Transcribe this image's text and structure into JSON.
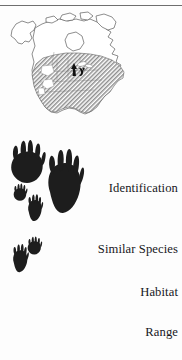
{
  "page": {
    "background_color": "#fdfdfd",
    "rule_color": "#6e6e6e",
    "text_color": "#17171c"
  },
  "range_map": {
    "name": "north-america-range-map",
    "outline_color": "#5a5a5a",
    "range_fill_color": "#8f8f8f",
    "land_fill_color": "#ffffff",
    "marker": {
      "name": "range-marker-arrow",
      "color": "#111111",
      "region": "great-lakes"
    }
  },
  "track_prints": {
    "ink_color": "#1b1b1b",
    "items": [
      {
        "name": "front-track-large",
        "label": ""
      },
      {
        "name": "hind-track-large",
        "label": ""
      },
      {
        "name": "front-track-small-upper",
        "label": ""
      },
      {
        "name": "hind-track-small-upper",
        "label": ""
      },
      {
        "name": "front-track-small-lower",
        "label": ""
      },
      {
        "name": "hind-track-small-lower",
        "label": ""
      }
    ]
  },
  "sections": [
    {
      "label": "Identification"
    },
    {
      "label": "Similar Species"
    },
    {
      "label": "Habitat"
    },
    {
      "label": "Range"
    }
  ]
}
